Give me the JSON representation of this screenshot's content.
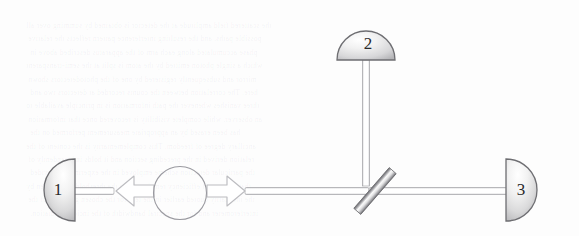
{
  "figure": {
    "kind": "optics-schematic",
    "caption": "",
    "background_color": "#fdfdfd",
    "ink_color": "#4a4a4a",
    "label_color": "#2a2a2a",
    "beam_fill": "#ffffff",
    "beam_stroke": "#a9a9ad",
    "arrow_stroke": "#b9b9bd",
    "detectors": [
      {
        "id": "detector-1",
        "label": "1",
        "shape": "half-disc",
        "orientation": "flat-right",
        "center_x": 75,
        "center_y": 190,
        "radius": 31
      },
      {
        "id": "detector-2",
        "label": "2",
        "shape": "half-disc",
        "orientation": "flat-bottom",
        "center_x": 366,
        "center_y": 60,
        "radius": 29
      },
      {
        "id": "detector-3",
        "label": "3",
        "shape": "half-disc",
        "orientation": "flat-left",
        "center_x": 506,
        "center_y": 190,
        "radius": 31
      }
    ],
    "source": {
      "id": "source-circle",
      "shape": "circle",
      "center_x": 180,
      "center_y": 193,
      "radius_x": 26,
      "radius_y": 26,
      "stroke": "#9a9aa0"
    },
    "beamsplitter": {
      "id": "beamsplitter",
      "shape": "tilted-bar",
      "center_x": 375,
      "center_y": 191,
      "length": 54,
      "thickness": 9,
      "angle_deg": -49
    },
    "beams": [
      {
        "id": "beam-detector1-to-arrow",
        "x1": 75,
        "y1": 191,
        "x2": 114,
        "y2": 191,
        "orientation": "horizontal"
      },
      {
        "id": "beam-source-to-beamsplitter",
        "x1": 246,
        "y1": 191,
        "x2": 368,
        "y2": 191,
        "orientation": "horizontal"
      },
      {
        "id": "beam-beamsplitter-to-detector3",
        "x1": 382,
        "y1": 191,
        "x2": 506,
        "y2": 191,
        "orientation": "horizontal"
      },
      {
        "id": "beam-beamsplitter-to-detector2",
        "x1": 366,
        "y1": 60,
        "x2": 366,
        "y2": 186,
        "orientation": "vertical"
      }
    ],
    "arrows": [
      {
        "id": "arrow-left",
        "direction": "left",
        "tip_x": 116,
        "tail_x": 152,
        "y": 191
      },
      {
        "id": "arrow-right",
        "direction": "right",
        "tip_x": 245,
        "tail_x": 209,
        "y": 191
      }
    ]
  },
  "background_text": {
    "note": "faint show-through text from reverse of scanned page",
    "lines": [
      "the scattered field amplitude at the detector is obtained by summing over all",
      "possible paths, and the resulting interference pattern reflects the relative",
      "phase accumulated along each arm of the apparatus described above in",
      "which a single photon emitted by the atom is split at the semi-transparent",
      "mirror and subsequently registered by one of the photodetectors shown",
      "here. The correlation between the counts recorded at detectors two and",
      "three vanishes whenever the path information is in principle available to",
      "an observer, while complete visibility is recovered once that information",
      "has been erased by an appropriate measurement performed on the",
      "ancillary degree of freedom. This complementarity is the content of the",
      "relation derived in the preceding section and it holds independently of",
      "the particular detection scheme employed in the experiment, provided",
      "that the overall efficiency remains above the threshold value given by",
      "the inequality quoted earlier in the text for the chosen geometry of the",
      "interferometer and for the spectral bandwidth of the incident radiation."
    ]
  }
}
